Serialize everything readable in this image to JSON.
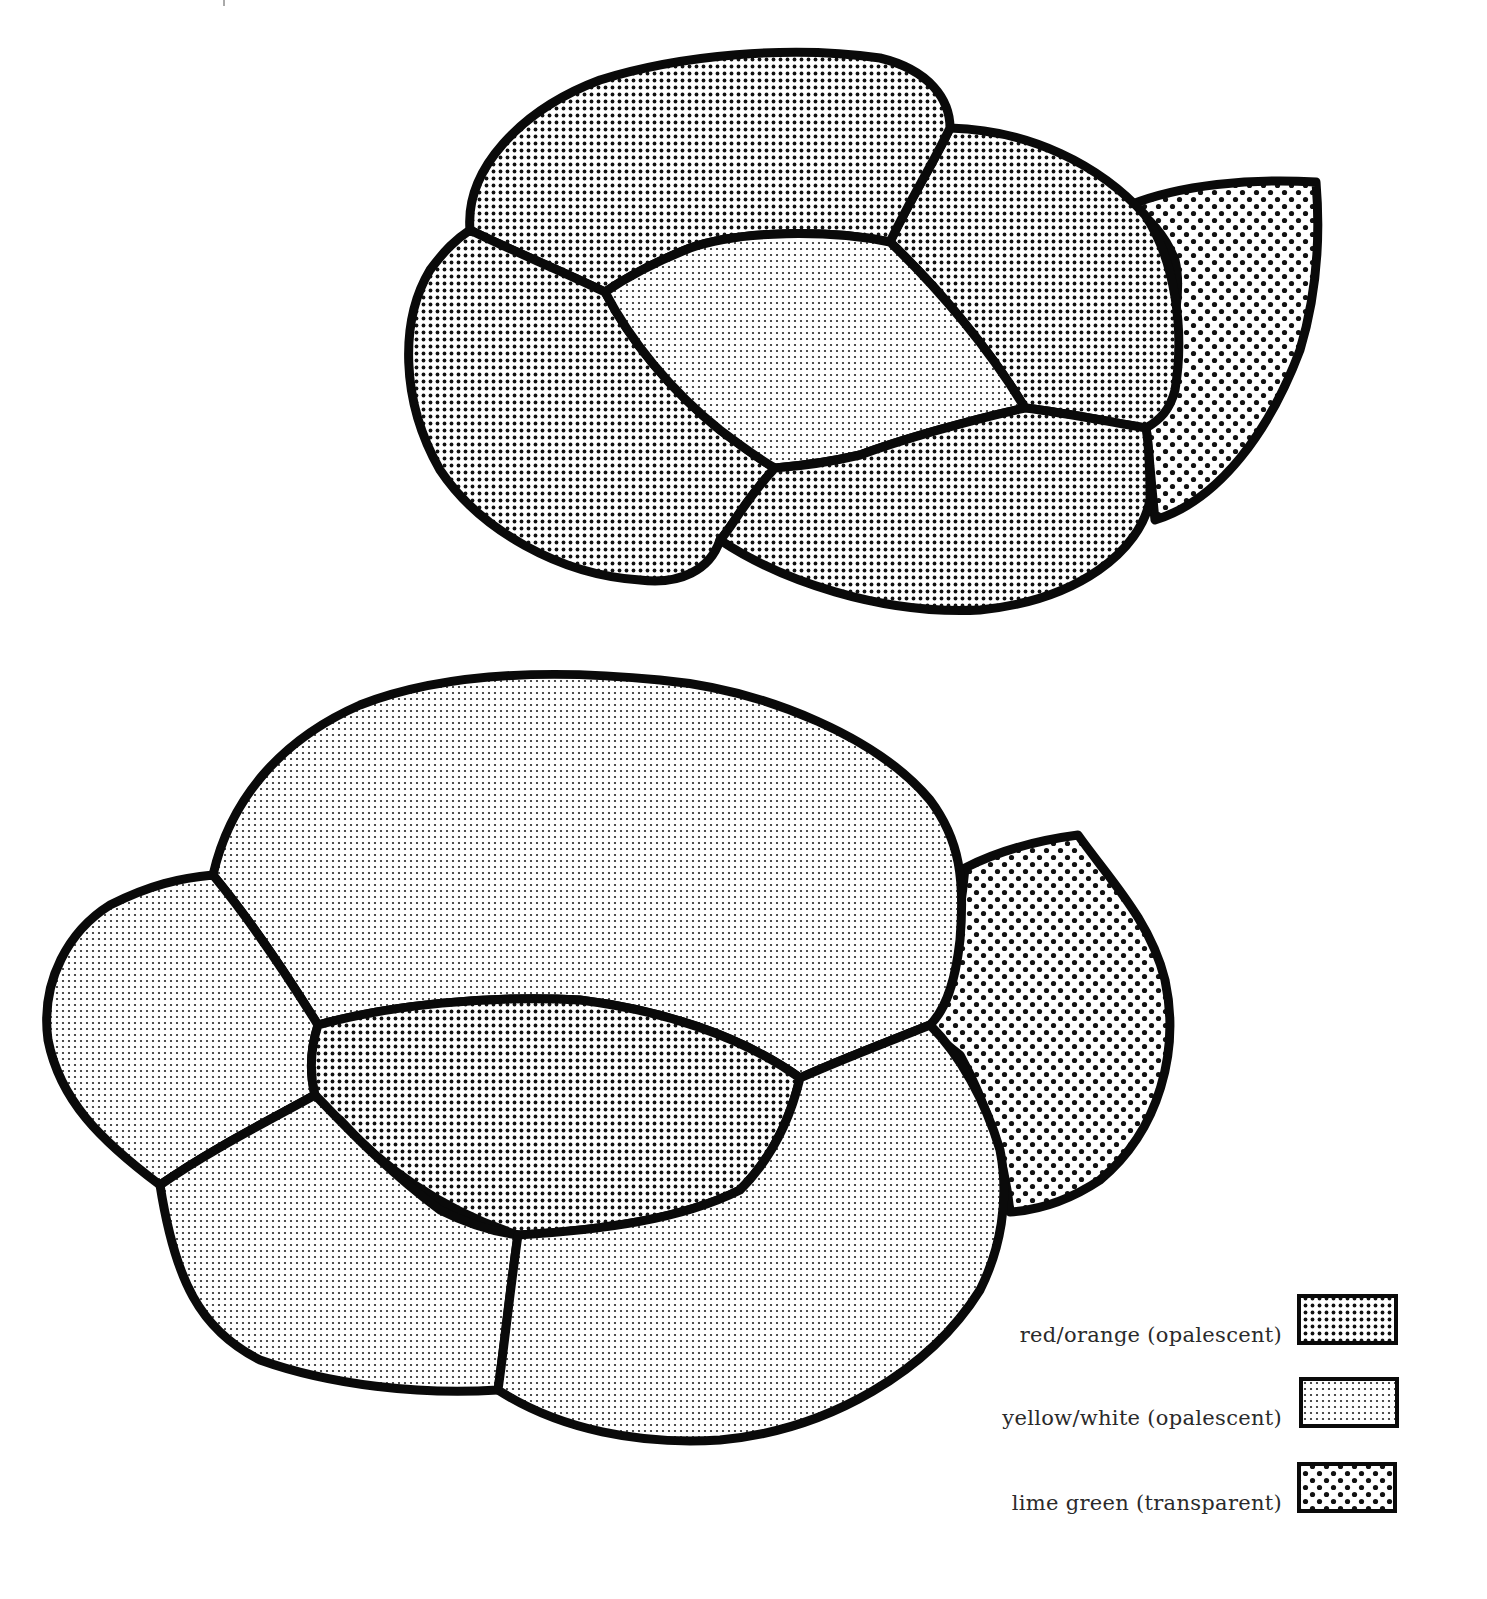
{
  "figures": [
    {
      "name": "top-cluster",
      "pieces": [
        {
          "id": "top-upper",
          "fill": "red_orange"
        },
        {
          "id": "top-left",
          "fill": "red_orange"
        },
        {
          "id": "top-right",
          "fill": "red_orange"
        },
        {
          "id": "top-center",
          "fill": "yellow_white"
        },
        {
          "id": "top-bottom",
          "fill": "red_orange"
        },
        {
          "id": "top-leaf",
          "fill": "lime_green"
        }
      ]
    },
    {
      "name": "bottom-cluster",
      "pieces": [
        {
          "id": "bottom-upper",
          "fill": "yellow_white"
        },
        {
          "id": "bottom-left",
          "fill": "yellow_white"
        },
        {
          "id": "bottom-center",
          "fill": "red_orange"
        },
        {
          "id": "bottom-lower-left",
          "fill": "yellow_white"
        },
        {
          "id": "bottom-lower-right",
          "fill": "yellow_white"
        },
        {
          "id": "bottom-leaf",
          "fill": "lime_green"
        }
      ]
    }
  ],
  "legend": {
    "items": [
      {
        "key": "red_orange",
        "label": "red/orange (opalescent)"
      },
      {
        "key": "yellow_white",
        "label": "yellow/white (opalescent)"
      },
      {
        "key": "lime_green",
        "label": "lime green (transparent)"
      }
    ]
  },
  "colors": {
    "ink": "#0a0a0a",
    "paper": "#ffffff"
  }
}
